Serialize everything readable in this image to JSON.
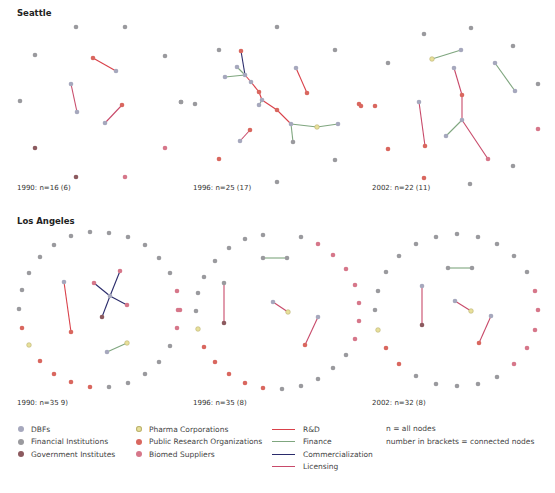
{
  "regions": [
    {
      "title": "Seattle",
      "title_pos": [
        17,
        8
      ]
    },
    {
      "title": "Los Angeles",
      "title_pos": [
        17,
        216
      ]
    }
  ],
  "colors": {
    "node": {
      "dbf": "#a6a8bd",
      "fin": "#9a9a9e",
      "gov": "#8c5a5f",
      "pharma": "#e8e09a",
      "pro": "#d9675f",
      "bio": "#d6778a"
    },
    "node_stroke": {
      "pharma": "#b9b070"
    },
    "edge": {
      "rd": "#d9414a",
      "fin": "#7fa67f",
      "com": "#2a2b6b",
      "lic": "#c84a6a"
    }
  },
  "panels": [
    {
      "label": "1990: n=16 (6)",
      "label_pos": [
        17,
        184
      ],
      "nodes": [
        {
          "x": 76,
          "y": 27,
          "t": "fin"
        },
        {
          "x": 125,
          "y": 27,
          "t": "fin"
        },
        {
          "x": 35,
          "y": 55,
          "t": "fin"
        },
        {
          "x": 165,
          "y": 56,
          "t": "fin"
        },
        {
          "x": 93,
          "y": 58,
          "t": "pro"
        },
        {
          "x": 116,
          "y": 71,
          "t": "dbf"
        },
        {
          "x": 71,
          "y": 84,
          "t": "dbf"
        },
        {
          "x": 77,
          "y": 112,
          "t": "dbf"
        },
        {
          "x": 20,
          "y": 101,
          "t": "fin"
        },
        {
          "x": 181,
          "y": 102,
          "t": "fin"
        },
        {
          "x": 122,
          "y": 105,
          "t": "pro"
        },
        {
          "x": 105,
          "y": 123,
          "t": "dbf"
        },
        {
          "x": 35,
          "y": 148,
          "t": "gov"
        },
        {
          "x": 165,
          "y": 148,
          "t": "bio"
        },
        {
          "x": 76,
          "y": 177,
          "t": "gov"
        },
        {
          "x": 125,
          "y": 177,
          "t": "bio"
        }
      ],
      "edges": [
        {
          "a": 4,
          "b": 5,
          "t": "rd"
        },
        {
          "a": 6,
          "b": 7,
          "t": "lic"
        },
        {
          "a": 10,
          "b": 11,
          "t": "lic"
        }
      ]
    },
    {
      "label": "1996: n=25 (17)",
      "label_pos": [
        193,
        184
      ],
      "nodes": [
        {
          "x": 277,
          "y": 27,
          "t": "fin"
        },
        {
          "x": 219,
          "y": 50,
          "t": "fin"
        },
        {
          "x": 241,
          "y": 51,
          "t": "pro"
        },
        {
          "x": 335,
          "y": 50,
          "t": "fin"
        },
        {
          "x": 237,
          "y": 67,
          "t": "dbf"
        },
        {
          "x": 245,
          "y": 75,
          "t": "dbf"
        },
        {
          "x": 225,
          "y": 77,
          "t": "dbf"
        },
        {
          "x": 251,
          "y": 82,
          "t": "dbf"
        },
        {
          "x": 296,
          "y": 68,
          "t": "dbf"
        },
        {
          "x": 259,
          "y": 92,
          "t": "pro"
        },
        {
          "x": 307,
          "y": 93,
          "t": "pro"
        },
        {
          "x": 262,
          "y": 100,
          "t": "dbf"
        },
        {
          "x": 259,
          "y": 105,
          "t": "dbf"
        },
        {
          "x": 181,
          "y": 102,
          "t": "fin"
        },
        {
          "x": 195,
          "y": 104,
          "t": "fin"
        },
        {
          "x": 359,
          "y": 104,
          "t": "pro"
        },
        {
          "x": 277,
          "y": 110,
          "t": "pro"
        },
        {
          "x": 291,
          "y": 124,
          "t": "dbf"
        },
        {
          "x": 317,
          "y": 127,
          "t": "pharma"
        },
        {
          "x": 338,
          "y": 124,
          "t": "dbf"
        },
        {
          "x": 250,
          "y": 130,
          "t": "pro"
        },
        {
          "x": 240,
          "y": 141,
          "t": "dbf"
        },
        {
          "x": 293,
          "y": 142,
          "t": "fin"
        },
        {
          "x": 219,
          "y": 159,
          "t": "pro"
        },
        {
          "x": 335,
          "y": 160,
          "t": "fin"
        },
        {
          "x": 277,
          "y": 182,
          "t": "fin"
        }
      ],
      "edges": [
        {
          "a": 2,
          "b": 5,
          "t": "com"
        },
        {
          "a": 4,
          "b": 5,
          "t": "fin"
        },
        {
          "a": 6,
          "b": 5,
          "t": "fin"
        },
        {
          "a": 5,
          "b": 7,
          "t": "rd"
        },
        {
          "a": 7,
          "b": 9,
          "t": "rd"
        },
        {
          "a": 9,
          "b": 11,
          "t": "rd"
        },
        {
          "a": 11,
          "b": 12,
          "t": "fin"
        },
        {
          "a": 11,
          "b": 16,
          "t": "rd"
        },
        {
          "a": 16,
          "b": 17,
          "t": "rd"
        },
        {
          "a": 17,
          "b": 18,
          "t": "fin"
        },
        {
          "a": 18,
          "b": 19,
          "t": "fin"
        },
        {
          "a": 17,
          "b": 22,
          "t": "fin"
        },
        {
          "a": 8,
          "b": 10,
          "t": "rd"
        },
        {
          "a": 20,
          "b": 21,
          "t": "lic"
        }
      ]
    },
    {
      "label": "2002: n=22 (11)",
      "label_pos": [
        372,
        184
      ],
      "nodes": [
        {
          "x": 471,
          "y": 28,
          "t": "fin"
        },
        {
          "x": 424,
          "y": 34,
          "t": "fin"
        },
        {
          "x": 513,
          "y": 46,
          "t": "fin"
        },
        {
          "x": 461,
          "y": 50,
          "t": "dbf"
        },
        {
          "x": 432,
          "y": 59,
          "t": "pharma"
        },
        {
          "x": 388,
          "y": 63,
          "t": "fin"
        },
        {
          "x": 454,
          "y": 68,
          "t": "dbf"
        },
        {
          "x": 495,
          "y": 63,
          "t": "dbf"
        },
        {
          "x": 538,
          "y": 84,
          "t": "fin"
        },
        {
          "x": 462,
          "y": 95,
          "t": "pro"
        },
        {
          "x": 515,
          "y": 91,
          "t": "dbf"
        },
        {
          "x": 419,
          "y": 102,
          "t": "dbf"
        },
        {
          "x": 375,
          "y": 106,
          "t": "pro"
        },
        {
          "x": 361,
          "y": 106,
          "t": "pro"
        },
        {
          "x": 462,
          "y": 120,
          "t": "dbf"
        },
        {
          "x": 538,
          "y": 129,
          "t": "bio"
        },
        {
          "x": 446,
          "y": 136,
          "t": "dbf"
        },
        {
          "x": 388,
          "y": 149,
          "t": "pro"
        },
        {
          "x": 425,
          "y": 146,
          "t": "pro"
        },
        {
          "x": 488,
          "y": 159,
          "t": "bio"
        },
        {
          "x": 513,
          "y": 166,
          "t": "fin"
        },
        {
          "x": 424,
          "y": 178,
          "t": "pro"
        },
        {
          "x": 470,
          "y": 184,
          "t": "fin"
        }
      ],
      "edges": [
        {
          "a": 4,
          "b": 3,
          "t": "fin"
        },
        {
          "a": 7,
          "b": 10,
          "t": "fin"
        },
        {
          "a": 6,
          "b": 9,
          "t": "lic"
        },
        {
          "a": 9,
          "b": 14,
          "t": "lic"
        },
        {
          "a": 14,
          "b": 16,
          "t": "fin"
        },
        {
          "a": 14,
          "b": 19,
          "t": "lic"
        },
        {
          "a": 11,
          "b": 18,
          "t": "lic"
        }
      ]
    },
    {
      "label": "1990: n=35 9)",
      "label_pos": [
        17,
        399
      ],
      "nodes": [
        {
          "x": 90,
          "y": 232,
          "t": "fin"
        },
        {
          "x": 109,
          "y": 233,
          "t": "fin"
        },
        {
          "x": 71,
          "y": 236,
          "t": "fin"
        },
        {
          "x": 128,
          "y": 237,
          "t": "fin"
        },
        {
          "x": 54,
          "y": 245,
          "t": "fin"
        },
        {
          "x": 145,
          "y": 245,
          "t": "fin"
        },
        {
          "x": 40,
          "y": 257,
          "t": "fin"
        },
        {
          "x": 159,
          "y": 258,
          "t": "fin"
        },
        {
          "x": 29,
          "y": 273,
          "t": "fin"
        },
        {
          "x": 170,
          "y": 273,
          "t": "fin"
        },
        {
          "x": 64,
          "y": 282,
          "t": "dbf"
        },
        {
          "x": 120,
          "y": 271,
          "t": "bio"
        },
        {
          "x": 94,
          "y": 283,
          "t": "bio"
        },
        {
          "x": 22,
          "y": 290,
          "t": "fin"
        },
        {
          "x": 177,
          "y": 291,
          "t": "bio"
        },
        {
          "x": 110,
          "y": 296,
          "t": "dbf"
        },
        {
          "x": 127,
          "y": 305,
          "t": "bio"
        },
        {
          "x": 19,
          "y": 309,
          "t": "fin"
        },
        {
          "x": 180,
          "y": 310,
          "t": "bio"
        },
        {
          "x": 102,
          "y": 317,
          "t": "gov"
        },
        {
          "x": 71,
          "y": 332,
          "t": "pro"
        },
        {
          "x": 22,
          "y": 328,
          "t": "pro"
        },
        {
          "x": 177,
          "y": 328,
          "t": "bio"
        },
        {
          "x": 29,
          "y": 345,
          "t": "pharma"
        },
        {
          "x": 127,
          "y": 343,
          "t": "pharma"
        },
        {
          "x": 170,
          "y": 346,
          "t": "fin"
        },
        {
          "x": 107,
          "y": 352,
          "t": "dbf"
        },
        {
          "x": 40,
          "y": 361,
          "t": "pro"
        },
        {
          "x": 159,
          "y": 362,
          "t": "fin"
        },
        {
          "x": 54,
          "y": 374,
          "t": "pro"
        },
        {
          "x": 145,
          "y": 374,
          "t": "fin"
        },
        {
          "x": 71,
          "y": 382,
          "t": "pro"
        },
        {
          "x": 128,
          "y": 383,
          "t": "fin"
        },
        {
          "x": 90,
          "y": 387,
          "t": "pro"
        },
        {
          "x": 109,
          "y": 387,
          "t": "fin"
        }
      ],
      "edges": [
        {
          "a": 10,
          "b": 20,
          "t": "rd"
        },
        {
          "a": 11,
          "b": 15,
          "t": "com"
        },
        {
          "a": 15,
          "b": 19,
          "t": "com"
        },
        {
          "a": 12,
          "b": 15,
          "t": "com"
        },
        {
          "a": 15,
          "b": 16,
          "t": "com"
        },
        {
          "a": 26,
          "b": 24,
          "t": "fin"
        }
      ]
    },
    {
      "label": "1996: n=35 (8)",
      "label_pos": [
        193,
        399
      ],
      "nodes": [
        {
          "x": 263,
          "y": 235,
          "t": "fin"
        },
        {
          "x": 301,
          "y": 237,
          "t": "fin"
        },
        {
          "x": 245,
          "y": 239,
          "t": "fin"
        },
        {
          "x": 318,
          "y": 244,
          "t": "bio"
        },
        {
          "x": 229,
          "y": 248,
          "t": "fin"
        },
        {
          "x": 333,
          "y": 255,
          "t": "bio"
        },
        {
          "x": 263,
          "y": 258,
          "t": "fin"
        },
        {
          "x": 287,
          "y": 258,
          "t": "fin"
        },
        {
          "x": 215,
          "y": 261,
          "t": "fin"
        },
        {
          "x": 346,
          "y": 269,
          "t": "bio"
        },
        {
          "x": 204,
          "y": 277,
          "t": "fin"
        },
        {
          "x": 224,
          "y": 283,
          "t": "fin"
        },
        {
          "x": 355,
          "y": 285,
          "t": "bio"
        },
        {
          "x": 198,
          "y": 293,
          "t": "fin"
        },
        {
          "x": 273,
          "y": 302,
          "t": "dbf"
        },
        {
          "x": 359,
          "y": 303,
          "t": "bio"
        },
        {
          "x": 288,
          "y": 312,
          "t": "pharma"
        },
        {
          "x": 318,
          "y": 317,
          "t": "dbf"
        },
        {
          "x": 196,
          "y": 311,
          "t": "fin"
        },
        {
          "x": 359,
          "y": 321,
          "t": "bio"
        },
        {
          "x": 224,
          "y": 323,
          "t": "gov"
        },
        {
          "x": 198,
          "y": 329,
          "t": "pharma"
        },
        {
          "x": 355,
          "y": 339,
          "t": "bio"
        },
        {
          "x": 305,
          "y": 345,
          "t": "pro"
        },
        {
          "x": 204,
          "y": 347,
          "t": "pro"
        },
        {
          "x": 346,
          "y": 355,
          "t": "fin"
        },
        {
          "x": 215,
          "y": 362,
          "t": "pro"
        },
        {
          "x": 333,
          "y": 368,
          "t": "fin"
        },
        {
          "x": 229,
          "y": 374,
          "t": "pro"
        },
        {
          "x": 318,
          "y": 379,
          "t": "fin"
        },
        {
          "x": 245,
          "y": 383,
          "t": "pro"
        },
        {
          "x": 301,
          "y": 386,
          "t": "fin"
        },
        {
          "x": 263,
          "y": 388,
          "t": "pro"
        },
        {
          "x": 282,
          "y": 389,
          "t": "fin"
        },
        {
          "x": 178,
          "y": 310,
          "t": "bio"
        }
      ],
      "edges": [
        {
          "a": 6,
          "b": 7,
          "t": "fin"
        },
        {
          "a": 11,
          "b": 20,
          "t": "lic"
        },
        {
          "a": 14,
          "b": 16,
          "t": "lic"
        },
        {
          "a": 17,
          "b": 23,
          "t": "lic"
        }
      ]
    },
    {
      "label": "2002: n=32 (8)",
      "label_pos": [
        372,
        399
      ],
      "nodes": [
        {
          "x": 457,
          "y": 234,
          "t": "fin"
        },
        {
          "x": 436,
          "y": 237,
          "t": "fin"
        },
        {
          "x": 478,
          "y": 237,
          "t": "fin"
        },
        {
          "x": 416,
          "y": 244,
          "t": "fin"
        },
        {
          "x": 497,
          "y": 244,
          "t": "fin"
        },
        {
          "x": 399,
          "y": 256,
          "t": "fin"
        },
        {
          "x": 514,
          "y": 256,
          "t": "fin"
        },
        {
          "x": 448,
          "y": 268,
          "t": "fin"
        },
        {
          "x": 472,
          "y": 268,
          "t": "fin"
        },
        {
          "x": 386,
          "y": 272,
          "t": "fin"
        },
        {
          "x": 527,
          "y": 272,
          "t": "fin"
        },
        {
          "x": 422,
          "y": 286,
          "t": "dbf"
        },
        {
          "x": 378,
          "y": 291,
          "t": "fin"
        },
        {
          "x": 535,
          "y": 291,
          "t": "bio"
        },
        {
          "x": 455,
          "y": 301,
          "t": "dbf"
        },
        {
          "x": 375,
          "y": 310,
          "t": "fin"
        },
        {
          "x": 538,
          "y": 310,
          "t": "bio"
        },
        {
          "x": 471,
          "y": 311,
          "t": "pharma"
        },
        {
          "x": 491,
          "y": 316,
          "t": "dbf"
        },
        {
          "x": 422,
          "y": 325,
          "t": "gov"
        },
        {
          "x": 378,
          "y": 330,
          "t": "pharma"
        },
        {
          "x": 535,
          "y": 330,
          "t": "bio"
        },
        {
          "x": 479,
          "y": 343,
          "t": "pro"
        },
        {
          "x": 386,
          "y": 348,
          "t": "pro"
        },
        {
          "x": 527,
          "y": 348,
          "t": "bio"
        },
        {
          "x": 399,
          "y": 364,
          "t": "pro"
        },
        {
          "x": 514,
          "y": 364,
          "t": "bio"
        },
        {
          "x": 416,
          "y": 376,
          "t": "fin"
        },
        {
          "x": 497,
          "y": 377,
          "t": "fin"
        },
        {
          "x": 436,
          "y": 384,
          "t": "fin"
        },
        {
          "x": 478,
          "y": 384,
          "t": "fin"
        },
        {
          "x": 457,
          "y": 386,
          "t": "fin"
        }
      ],
      "edges": [
        {
          "a": 7,
          "b": 8,
          "t": "fin"
        },
        {
          "a": 11,
          "b": 19,
          "t": "lic"
        },
        {
          "a": 14,
          "b": 17,
          "t": "lic"
        },
        {
          "a": 18,
          "b": 22,
          "t": "lic"
        }
      ]
    }
  ],
  "legend": {
    "node_types": [
      {
        "key": "dbf",
        "label": "DBFs"
      },
      {
        "key": "fin",
        "label": "Financial Institutions"
      },
      {
        "key": "gov",
        "label": "Government Institutes"
      },
      {
        "key": "pharma",
        "label": "Pharma Corporations"
      },
      {
        "key": "pro",
        "label": "Public Research Organizations"
      },
      {
        "key": "bio",
        "label": "Biomed Suppliers"
      }
    ],
    "edge_types": [
      {
        "key": "rd",
        "label": "R&D"
      },
      {
        "key": "fin",
        "label": "Finance"
      },
      {
        "key": "com",
        "label": "Commercialization"
      },
      {
        "key": "lic",
        "label": "Licensing"
      }
    ],
    "notes": [
      "n = all nodes",
      "number in brackets = connected nodes"
    ]
  }
}
